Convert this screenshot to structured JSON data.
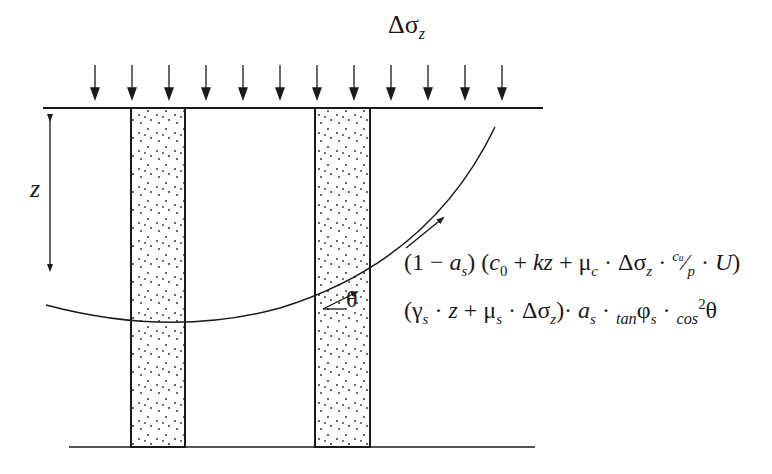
{
  "diagram": {
    "load_label": {
      "base": "Δσ",
      "sub": "z"
    },
    "depth_label": "z",
    "angle_label": "θ",
    "formula_line1": {
      "p1": "(1 − ",
      "a": "a",
      "a_sub": "s",
      "p2": ") (",
      "c": "c",
      "c_sub": "0",
      "p3": " + ",
      "kz": "kz",
      "p4": " + μ",
      "mu_sub": "c",
      "p5": " · Δσ",
      "ds_sub": "z",
      "p6": " · ",
      "cu": "c",
      "cu_sub": "u",
      "slash": "⁄",
      "p": "p",
      "p7": " · ",
      "U": "U",
      "p8": ")"
    },
    "formula_line2": {
      "p1": "(γ",
      "g_sub": "s",
      "p2": " · ",
      "z": "z",
      "p3": " + μ",
      "mu_sub": "s",
      "p4": " · Δσ",
      "ds_sub": "z",
      "p5": ")· ",
      "a": "a",
      "a_sub": "s",
      "p6": " · ",
      "tan": "tan",
      "phi": "φ",
      "phi_sub": "s",
      "p7": " · ",
      "cos": "cos",
      "cos_sup": "2",
      "theta": "θ"
    },
    "load_arrow_count": 12,
    "colors": {
      "line": "#1a1a1a",
      "column_fill": "#ffffff",
      "dots": "#333333"
    }
  }
}
